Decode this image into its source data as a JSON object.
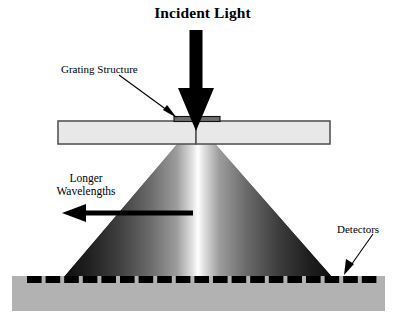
{
  "figure": {
    "title": "Incident Light",
    "type": "optical-grating-spectrometer-schematic",
    "background_color": "#ffffff"
  },
  "labels": {
    "incident_light": "Incident Light",
    "grating_structure": "Grating Structure",
    "longer_wavelengths_line1": "Longer",
    "longer_wavelengths_line2": "Wavelengths",
    "detectors": "Detectors"
  },
  "colors": {
    "ink": "#000000",
    "substrate_fill": "#e8e8e8",
    "substrate_border": "#555555",
    "grating_fill": "#6e6e6e",
    "grating_border": "#1a1a1a",
    "detector_block_fill": "#b2b2b2",
    "detector_pixel": "#000000",
    "beam_center": "#ffffff",
    "beam_edge": "#1c1c1c"
  },
  "components": {
    "incident_beam_arrow": {
      "name": "incident-light-arrow",
      "direction": "down",
      "shaft_x": 196,
      "shaft_top": 30,
      "shaft_bottom": 88,
      "shaft_width": 13,
      "head_half_width": 18,
      "tip_y": 131
    },
    "substrate": {
      "name": "substrate-slab",
      "x": 58,
      "y": 121,
      "width": 272,
      "height": 23
    },
    "grating": {
      "name": "grating-structure-bar",
      "x": 174,
      "y": 117,
      "width": 46,
      "height": 5
    },
    "light_cone": {
      "name": "dispersed-light-cone",
      "apex_x": 196,
      "apex_y": 122,
      "left_base_x": 64,
      "right_base_x": 332,
      "base_y": 277
    },
    "detector_block": {
      "name": "detector-substrate-block",
      "x": 12,
      "y": 276,
      "width": 373,
      "height": 35
    },
    "detector_pixels": {
      "name": "detector-pixel-array",
      "count": 19,
      "x_start": 27,
      "y": 276,
      "pitch": 18.6,
      "pixel_width": 14.6,
      "pixel_height": 7
    },
    "wavelength_arrow": {
      "name": "longer-wavelengths-arrow",
      "direction": "left",
      "tail_x": 193,
      "head_x": 62,
      "y": 213,
      "shaft_thickness": 5,
      "head_half_height": 9,
      "head_length": 22
    },
    "grating_pointer": {
      "name": "grating-structure-leader-arrow",
      "from_x": 120,
      "from_y": 76,
      "to_x": 176,
      "to_y": 118
    },
    "detector_pointer": {
      "name": "detectors-leader-arrow",
      "from_x": 372,
      "from_y": 235,
      "to_x": 344,
      "to_y": 274
    }
  }
}
